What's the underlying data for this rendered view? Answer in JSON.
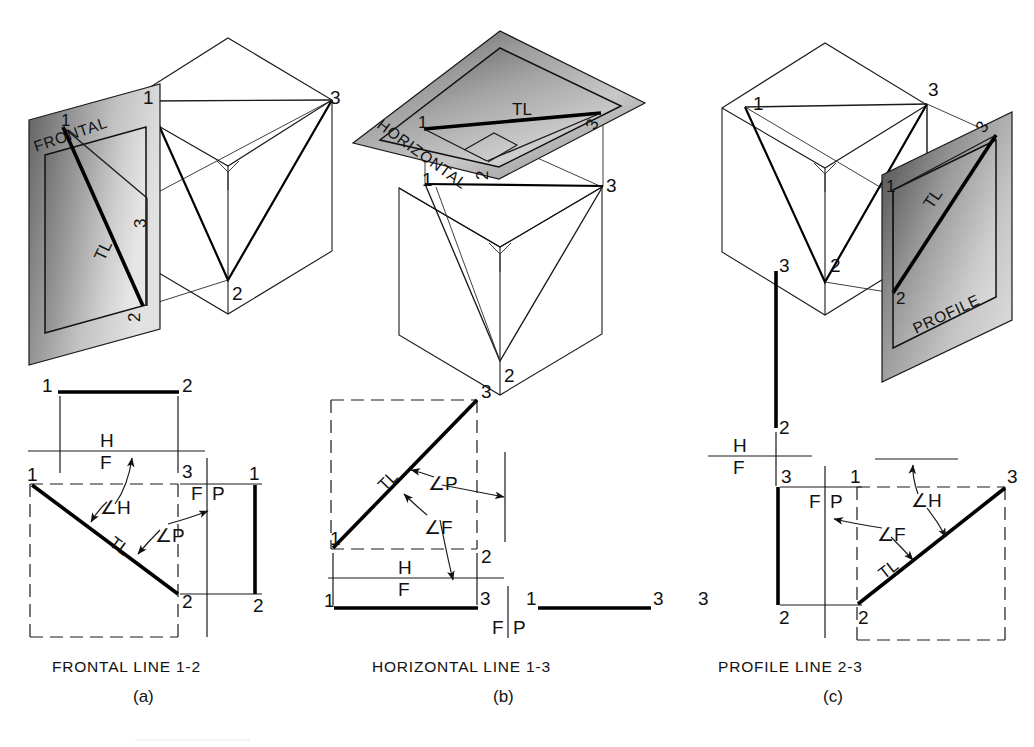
{
  "figure": {
    "panels": [
      {
        "id": "a",
        "letter": "(a)",
        "caption": "FRONTAL LINE 1-2",
        "plane_label": "FRONTAL",
        "true_length_label": "TL",
        "pictorial": {
          "vertex_labels": [
            "1",
            "2",
            "3"
          ],
          "projected_vertex_labels": [
            "1",
            "2",
            "3"
          ],
          "axis_symbol": "Y"
        },
        "orthographic": {
          "top_view_labels": [
            "1",
            "2"
          ],
          "front_view_labels": [
            "1",
            "3",
            "2"
          ],
          "side_view_labels": [
            "1",
            "2"
          ],
          "true_length_label": "TL",
          "angle_labels": [
            "∠H",
            "∠P"
          ],
          "reference_lines": [
            {
              "upper": "H",
              "lower": "F"
            },
            {
              "left": "F",
              "right": "P"
            }
          ]
        }
      },
      {
        "id": "b",
        "letter": "(b)",
        "caption": "HORIZONTAL LINE 1-3",
        "plane_label": "HORIZONTAL",
        "true_length_label": "TL",
        "pictorial": {
          "vertex_labels": [
            "1",
            "2",
            "3"
          ],
          "projected_vertex_labels": [
            "1",
            "2",
            "3"
          ],
          "axis_symbol": "Y"
        },
        "orthographic": {
          "top_view_labels": [
            "1",
            "3",
            "2"
          ],
          "front_view_labels": [
            "1",
            "3"
          ],
          "side_view_labels": [
            "1",
            "3"
          ],
          "true_length_label": "TL",
          "angle_labels": [
            "∠P",
            "∠F"
          ],
          "reference_lines": [
            {
              "upper": "H",
              "lower": "F"
            },
            {
              "left": "F",
              "right": "P"
            }
          ]
        }
      },
      {
        "id": "c",
        "letter": "(c)",
        "caption": "PROFILE LINE 2-3",
        "plane_label": "PROFILE",
        "true_length_label": "TL",
        "pictorial": {
          "vertex_labels": [
            "1",
            "2",
            "3"
          ],
          "projected_vertex_labels": [
            "1",
            "2",
            "3"
          ],
          "axis_symbol": "Y"
        },
        "orthographic": {
          "top_view_labels": [
            "3",
            "2"
          ],
          "front_view_labels": [
            "3",
            "2"
          ],
          "side_view_labels": [
            "1",
            "3",
            "2"
          ],
          "true_length_label": "TL",
          "angle_labels": [
            "∠H",
            "∠F"
          ],
          "reference_lines": [
            {
              "upper": "H",
              "lower": "F"
            },
            {
              "left": "F",
              "right": "P"
            }
          ]
        }
      }
    ],
    "glyphs": {
      "one": "1",
      "two": "2",
      "three": "3",
      "tl": "TL",
      "h": "H",
      "f": "F",
      "p": "P",
      "angle_h": "∠H",
      "angle_f": "∠F",
      "angle_p": "∠P",
      "y_axis": "Y"
    },
    "colors": {
      "line": "#111111",
      "plane_light": "#d7d7d7",
      "plane_mid": "#a8a8a8",
      "plane_dark": "#6d6d6d",
      "background": "#ffffff"
    }
  }
}
